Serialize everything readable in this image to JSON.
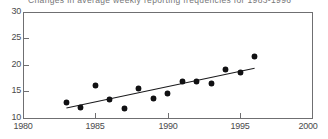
{
  "chart_data": {
    "type": "scatter",
    "title": "Changes in average weekly reporting frequencies for 1983-1996",
    "xlabel": "",
    "ylabel": "",
    "xlim": [
      1980,
      2000
    ],
    "ylim": [
      10,
      30
    ],
    "xticks": [
      1980,
      1985,
      1990,
      1995,
      2000
    ],
    "yticks": [
      10,
      15,
      20,
      25,
      30
    ],
    "xtick_labels": [
      "1980",
      "1985",
      "1990",
      "1995",
      "2000"
    ],
    "ytick_labels": [
      "10",
      "15",
      "20",
      "25",
      "30"
    ],
    "grid": false,
    "legend": false,
    "legend_position": "none",
    "marker_color": "#111113",
    "trend_color": "#1a1a1c",
    "axis_color": "#6f6f71",
    "background_color": "#ffffff",
    "x": [
      1983,
      1984,
      1985,
      1986,
      1987,
      1988,
      1989,
      1990,
      1991,
      1992,
      1993,
      1994,
      1995,
      1996
    ],
    "values": [
      13.0,
      11.9,
      16.2,
      13.5,
      11.8,
      15.6,
      13.6,
      14.7,
      16.8,
      16.9,
      16.6,
      19.2,
      18.6,
      21.6
    ],
    "series": [
      {
        "name": "Average weekly reporting frequency",
        "x": [
          1983,
          1984,
          1985,
          1986,
          1987,
          1988,
          1989,
          1990,
          1991,
          1992,
          1993,
          1994,
          1995,
          1996
        ],
        "values": [
          13.0,
          11.9,
          16.2,
          13.5,
          11.8,
          15.6,
          13.6,
          14.7,
          16.8,
          16.9,
          16.6,
          19.2,
          18.6,
          21.6
        ]
      }
    ],
    "trend_line": {
      "name": "linear trend",
      "x": [
        1983,
        1996
      ],
      "values": [
        11.9,
        19.4
      ]
    }
  }
}
